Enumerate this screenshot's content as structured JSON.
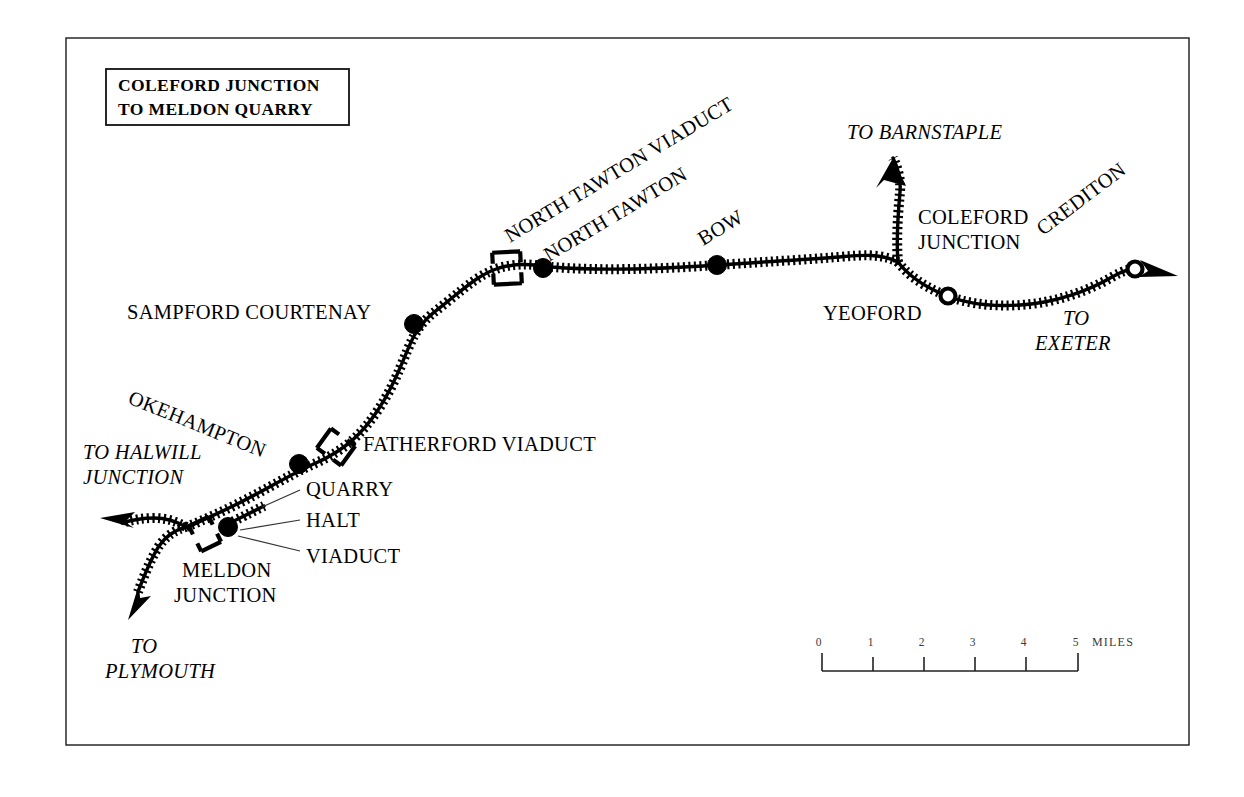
{
  "map": {
    "title_lines": [
      "COLEFORD JUNCTION",
      "TO MELDON QUARRY"
    ],
    "background_color": "#ffffff",
    "ink_color": "#000000",
    "frame": {
      "present": true,
      "color": "#1a1a1a"
    },
    "stations": [
      {
        "id": "meldon-junction",
        "label": "MELDON",
        "label2": "JUNCTION",
        "marker": "filled-dot"
      },
      {
        "id": "okehampton",
        "label": "OKEHAMPTON",
        "marker": "filled-dot"
      },
      {
        "id": "sampford-courtenay",
        "label": "SAMPFORD COURTENAY",
        "marker": "filled-dot"
      },
      {
        "id": "north-tawton",
        "label": "NORTH TAWTON",
        "marker": "filled-dot"
      },
      {
        "id": "bow",
        "label": "BOW",
        "marker": "filled-dot"
      },
      {
        "id": "yeoford",
        "label": "YEOFORD",
        "marker": "open-circle"
      },
      {
        "id": "crediton",
        "label": "CREDITON",
        "marker": "open-circle"
      }
    ],
    "junction_labels": [
      {
        "id": "coleford-junction",
        "line1": "COLEFORD",
        "line2": "JUNCTION"
      }
    ],
    "feature_labels": [
      {
        "id": "meldon-quarry",
        "text": "QUARRY"
      },
      {
        "id": "meldon-halt",
        "text": "HALT"
      },
      {
        "id": "meldon-viaduct",
        "text": "VIADUCT"
      },
      {
        "id": "fatherford-viaduct",
        "text": "FATHERFORD VIADUCT"
      },
      {
        "id": "north-tawton-viaduct",
        "text": "NORTH TAWTON VIADUCT"
      }
    ],
    "direction_arrows": [
      {
        "id": "to-barnstaple",
        "line1": "TO BARNSTAPLE",
        "line2": ""
      },
      {
        "id": "to-exeter",
        "line1": "TO",
        "line2": "EXETER"
      },
      {
        "id": "to-halwill-junction",
        "line1": "TO HALWILL",
        "line2": "JUNCTION"
      },
      {
        "id": "to-plymouth",
        "line1": "TO",
        "line2": "PLYMOUTH"
      }
    ],
    "scale_bar": {
      "ticks": [
        "0",
        "1",
        "2",
        "3",
        "4",
        "5"
      ],
      "unit": "MILES",
      "max_miles": 5
    }
  }
}
